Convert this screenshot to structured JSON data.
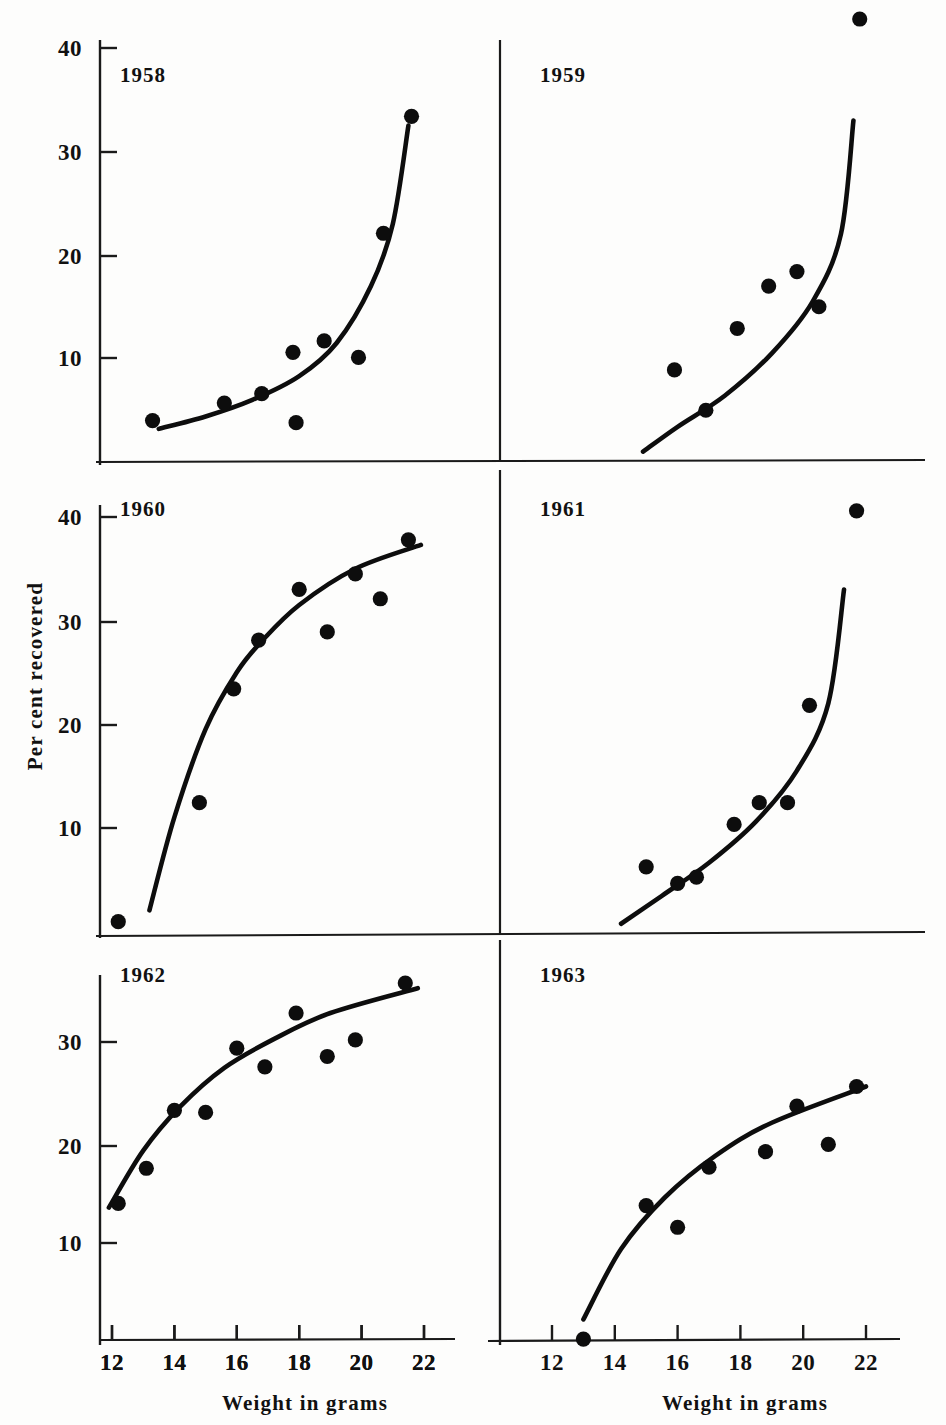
{
  "figure": {
    "background_color": "#fdfdfc",
    "ink_color": "#0d0d0d",
    "y_axis_title": "Per cent recovered",
    "x_axis_title_left": "Weight in grams",
    "x_axis_title_right": "Weight in grams"
  },
  "chart_data": [
    {
      "type": "scatter",
      "title": "1958",
      "xlabel": "Weight in grams",
      "ylabel": "Per cent recovered",
      "xlim": [
        11.0,
        23.0
      ],
      "ylim": [
        0,
        41
      ],
      "xticks": [
        12,
        14,
        16,
        18,
        20,
        22
      ],
      "yticks": [
        10,
        20,
        30,
        40
      ],
      "grid": false,
      "legend": "none",
      "points": [
        {
          "x": 13.3,
          "y": 4.0
        },
        {
          "x": 15.6,
          "y": 5.7
        },
        {
          "x": 16.8,
          "y": 6.6
        },
        {
          "x": 17.8,
          "y": 10.6
        },
        {
          "x": 17.9,
          "y": 3.8
        },
        {
          "x": 18.8,
          "y": 11.7
        },
        {
          "x": 19.9,
          "y": 10.1
        },
        {
          "x": 20.7,
          "y": 22.1
        },
        {
          "x": 21.6,
          "y": 33.4
        }
      ],
      "fit_curve": [
        {
          "x": 13.5,
          "y": 3.2
        },
        {
          "x": 15.0,
          "y": 4.4
        },
        {
          "x": 16.5,
          "y": 6.0
        },
        {
          "x": 18.0,
          "y": 8.3
        },
        {
          "x": 19.2,
          "y": 11.5
        },
        {
          "x": 20.3,
          "y": 17.0
        },
        {
          "x": 21.0,
          "y": 23.0
        },
        {
          "x": 21.5,
          "y": 32.5
        }
      ]
    },
    {
      "type": "scatter",
      "title": "1959",
      "xlabel": "Weight in grams",
      "ylabel": "Per cent recovered",
      "xlim": [
        11.0,
        23.0
      ],
      "ylim": [
        0,
        41
      ],
      "xticks": [
        12,
        14,
        16,
        18,
        20,
        22
      ],
      "yticks": [
        10,
        20,
        30,
        40
      ],
      "grid": false,
      "legend": "none",
      "points": [
        {
          "x": 15.9,
          "y": 8.9
        },
        {
          "x": 16.9,
          "y": 5.0
        },
        {
          "x": 17.9,
          "y": 12.9
        },
        {
          "x": 18.9,
          "y": 17.0
        },
        {
          "x": 19.8,
          "y": 18.4
        },
        {
          "x": 20.5,
          "y": 15.0
        },
        {
          "x": 21.8,
          "y": 42.8
        }
      ],
      "fit_curve": [
        {
          "x": 14.9,
          "y": 1.0
        },
        {
          "x": 16.0,
          "y": 3.4
        },
        {
          "x": 17.5,
          "y": 6.4
        },
        {
          "x": 19.0,
          "y": 10.5
        },
        {
          "x": 20.3,
          "y": 15.5
        },
        {
          "x": 21.2,
          "y": 22.0
        },
        {
          "x": 21.6,
          "y": 33.0
        }
      ]
    },
    {
      "type": "scatter",
      "title": "1960",
      "xlabel": "Weight in grams",
      "ylabel": "Per cent recovered",
      "xlim": [
        11.0,
        23.0
      ],
      "ylim": [
        0,
        41
      ],
      "xticks": [
        12,
        14,
        16,
        18,
        20,
        22
      ],
      "yticks": [
        10,
        20,
        30,
        40
      ],
      "grid": false,
      "legend": "none",
      "points": [
        {
          "x": 12.2,
          "y": 0.9
        },
        {
          "x": 14.8,
          "y": 12.4
        },
        {
          "x": 15.9,
          "y": 23.4
        },
        {
          "x": 16.7,
          "y": 28.1
        },
        {
          "x": 18.0,
          "y": 33.0
        },
        {
          "x": 18.9,
          "y": 28.9
        },
        {
          "x": 19.8,
          "y": 34.5
        },
        {
          "x": 20.6,
          "y": 32.1
        },
        {
          "x": 21.5,
          "y": 37.8
        }
      ],
      "fit_curve": [
        {
          "x": 13.2,
          "y": 2.0
        },
        {
          "x": 14.0,
          "y": 11.0
        },
        {
          "x": 15.0,
          "y": 19.5
        },
        {
          "x": 16.0,
          "y": 25.0
        },
        {
          "x": 16.8,
          "y": 28.0
        },
        {
          "x": 18.0,
          "y": 31.5
        },
        {
          "x": 19.8,
          "y": 35.0
        },
        {
          "x": 21.9,
          "y": 37.3
        }
      ]
    },
    {
      "type": "scatter",
      "title": "1961",
      "xlabel": "Weight in grams",
      "ylabel": "Per cent recovered",
      "xlim": [
        11.0,
        23.0
      ],
      "ylim": [
        0,
        41
      ],
      "xticks": [
        12,
        14,
        16,
        18,
        20,
        22
      ],
      "yticks": [
        10,
        20,
        30,
        40
      ],
      "grid": false,
      "legend": "none",
      "points": [
        {
          "x": 15.0,
          "y": 6.2
        },
        {
          "x": 16.0,
          "y": 4.6
        },
        {
          "x": 16.6,
          "y": 5.2
        },
        {
          "x": 17.8,
          "y": 10.3
        },
        {
          "x": 18.6,
          "y": 12.4
        },
        {
          "x": 19.5,
          "y": 12.4
        },
        {
          "x": 20.2,
          "y": 21.8
        },
        {
          "x": 21.7,
          "y": 40.6
        }
      ],
      "fit_curve": [
        {
          "x": 14.2,
          "y": 0.7
        },
        {
          "x": 15.5,
          "y": 3.4
        },
        {
          "x": 17.0,
          "y": 6.6
        },
        {
          "x": 18.5,
          "y": 10.6
        },
        {
          "x": 19.8,
          "y": 15.5
        },
        {
          "x": 20.8,
          "y": 22.0
        },
        {
          "x": 21.3,
          "y": 33.0
        }
      ]
    },
    {
      "type": "scatter",
      "title": "1962",
      "xlabel": "Weight in grams",
      "ylabel": "Per cent recovered",
      "xlim": [
        11.0,
        23.0
      ],
      "ylim": [
        0,
        41
      ],
      "xticks": [
        12,
        14,
        16,
        18,
        20,
        22
      ],
      "yticks": [
        10,
        20,
        30
      ],
      "grid": false,
      "legend": "none",
      "points": [
        {
          "x": 12.2,
          "y": 14.4
        },
        {
          "x": 13.1,
          "y": 17.8
        },
        {
          "x": 14.0,
          "y": 23.4
        },
        {
          "x": 15.0,
          "y": 23.2
        },
        {
          "x": 16.0,
          "y": 29.4
        },
        {
          "x": 16.9,
          "y": 27.6
        },
        {
          "x": 17.9,
          "y": 32.8
        },
        {
          "x": 18.9,
          "y": 28.6
        },
        {
          "x": 19.8,
          "y": 30.2
        },
        {
          "x": 21.4,
          "y": 35.7
        }
      ],
      "fit_curve": [
        {
          "x": 11.9,
          "y": 14.0
        },
        {
          "x": 13.0,
          "y": 19.5
        },
        {
          "x": 14.2,
          "y": 23.8
        },
        {
          "x": 15.6,
          "y": 27.5
        },
        {
          "x": 17.2,
          "y": 30.3
        },
        {
          "x": 19.0,
          "y": 32.8
        },
        {
          "x": 21.8,
          "y": 35.2
        }
      ]
    },
    {
      "type": "scatter",
      "title": "1963",
      "xlabel": "Weight in grams",
      "ylabel": "Per cent recovered",
      "xlim": [
        11.0,
        23.0
      ],
      "ylim": [
        0,
        41
      ],
      "xticks": [
        12,
        14,
        16,
        18,
        20,
        22
      ],
      "yticks": [
        10,
        20,
        30
      ],
      "grid": false,
      "legend": "none",
      "points": [
        {
          "x": 13.0,
          "y": 11.3
        },
        {
          "x": 15.0,
          "y": 24.2
        },
        {
          "x": 16.0,
          "y": 22.1
        },
        {
          "x": 17.0,
          "y": 27.9
        },
        {
          "x": 18.8,
          "y": 29.4
        },
        {
          "x": 19.8,
          "y": 33.8
        },
        {
          "x": 20.8,
          "y": 30.1
        },
        {
          "x": 21.7,
          "y": 35.7
        }
      ],
      "fit_curve": [
        {
          "x": 13.0,
          "y": 13.2
        },
        {
          "x": 14.2,
          "y": 20.0
        },
        {
          "x": 15.6,
          "y": 25.0
        },
        {
          "x": 17.2,
          "y": 29.0
        },
        {
          "x": 19.0,
          "y": 32.2
        },
        {
          "x": 22.0,
          "y": 35.7
        }
      ]
    }
  ],
  "panels": [
    {
      "year": "1958",
      "tick_labels_y": [
        "40",
        "30",
        "20",
        "10"
      ],
      "tick_labels_x": [
        "12",
        "14",
        "16",
        "18",
        "20",
        "22"
      ]
    },
    {
      "year": "1959",
      "tick_labels_y": [],
      "tick_labels_x": []
    },
    {
      "year": "1960",
      "tick_labels_y": [
        "40",
        "30",
        "20",
        "10"
      ],
      "tick_labels_x": []
    },
    {
      "year": "1961",
      "tick_labels_y": [],
      "tick_labels_x": []
    },
    {
      "year": "1962",
      "tick_labels_y": [
        "30",
        "20",
        "10"
      ],
      "tick_labels_x": [
        "12",
        "14",
        "16",
        "18",
        "20",
        "22"
      ]
    },
    {
      "year": "1963",
      "tick_labels_y": [],
      "tick_labels_x": [
        "12",
        "14",
        "16",
        "18",
        "20",
        "22"
      ]
    }
  ]
}
